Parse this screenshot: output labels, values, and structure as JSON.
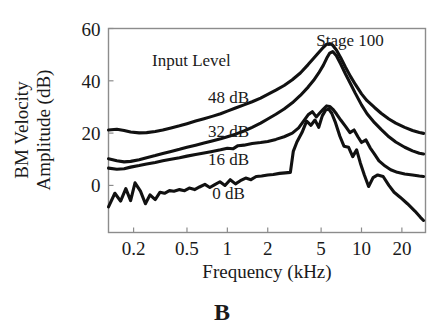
{
  "figure": {
    "panel_letter": "B",
    "background_color": "#ffffff",
    "curve_color": "#111111",
    "frame_color": "#8c8c8c"
  },
  "chart_data": {
    "type": "line",
    "title": "",
    "annotation_title": "Stage 100",
    "legend_heading": "Input Level",
    "xlabel": "Frequency  (kHz)",
    "ylabel_line1": "BM  Velocity",
    "ylabel_line2": "Amplitude  (dB)",
    "xscale": "log",
    "xlim": [
      0.13,
      30
    ],
    "ylim": [
      -18,
      60
    ],
    "xticks": [
      0.2,
      0.5,
      1,
      2,
      5,
      10,
      20
    ],
    "xtick_labels": [
      "0.2",
      "0.5",
      "1",
      "2",
      "5",
      "10",
      "20"
    ],
    "yticks": [
      0,
      20,
      40,
      60
    ],
    "ytick_labels": [
      "0",
      "20",
      "40",
      "60"
    ],
    "grid": false,
    "legend_position": "inline-curve-labels",
    "series": [
      {
        "name": "48 dB",
        "label": "48 dB",
        "label_x": 1.02,
        "label_y": 31.5,
        "x": [
          0.13,
          0.15,
          0.17,
          0.19,
          0.22,
          0.25,
          0.29,
          0.33,
          0.38,
          0.44,
          0.5,
          0.58,
          0.67,
          0.77,
          0.89,
          1.0,
          1.15,
          1.33,
          1.53,
          1.77,
          2.0,
          2.3,
          2.65,
          3.05,
          3.5,
          4.0,
          4.4,
          4.8,
          5.2,
          5.5,
          5.8,
          6.1,
          6.5,
          7.0,
          7.6,
          8.3,
          9.0,
          10.0,
          11.0,
          12.5,
          14.0,
          16.0,
          18.0,
          21.0,
          24.0,
          27.0,
          29.0
        ],
        "y": [
          21.2,
          21.5,
          21.0,
          20.4,
          20.1,
          20.2,
          20.6,
          21.2,
          22.0,
          22.8,
          23.6,
          24.6,
          25.5,
          26.4,
          27.4,
          28.4,
          29.6,
          30.8,
          32.0,
          33.4,
          34.8,
          36.4,
          38.2,
          40.4,
          43.0,
          46.2,
          48.6,
          50.8,
          52.8,
          54.0,
          54.2,
          53.6,
          51.8,
          48.8,
          45.2,
          41.6,
          38.6,
          35.0,
          32.4,
          29.8,
          27.6,
          25.4,
          23.8,
          22.2,
          21.0,
          20.2,
          19.9
        ]
      },
      {
        "name": "32 dB",
        "label": "32 dB",
        "label_x": 1.02,
        "label_y": 18.5,
        "x": [
          0.13,
          0.15,
          0.17,
          0.19,
          0.22,
          0.25,
          0.29,
          0.33,
          0.38,
          0.44,
          0.5,
          0.58,
          0.67,
          0.77,
          0.89,
          1.0,
          1.15,
          1.33,
          1.53,
          1.77,
          2.0,
          2.3,
          2.65,
          3.05,
          3.5,
          4.0,
          4.4,
          4.8,
          5.2,
          5.5,
          5.8,
          6.1,
          6.5,
          7.0,
          7.6,
          8.3,
          9.0,
          10.0,
          11.0,
          12.5,
          14.0,
          16.0,
          18.0,
          21.0,
          24.0,
          27.0,
          29.0
        ],
        "y": [
          10.2,
          9.4,
          9.0,
          9.2,
          9.8,
          10.6,
          11.4,
          12.2,
          13.0,
          13.8,
          14.6,
          15.4,
          16.2,
          17.0,
          17.8,
          18.6,
          19.6,
          20.8,
          22.2,
          23.8,
          25.4,
          27.2,
          29.2,
          31.6,
          34.4,
          37.6,
          40.2,
          43.0,
          46.0,
          48.6,
          50.6,
          51.2,
          49.6,
          46.4,
          42.6,
          38.8,
          35.2,
          30.8,
          27.4,
          24.0,
          21.4,
          18.6,
          16.6,
          14.6,
          13.2,
          12.3,
          12.0
        ]
      },
      {
        "name": "16 dB",
        "label": "16 dB",
        "label_x": 1.02,
        "label_y": 8.0,
        "x": [
          0.13,
          0.15,
          0.17,
          0.19,
          0.22,
          0.25,
          0.29,
          0.33,
          0.38,
          0.44,
          0.5,
          0.58,
          0.67,
          0.77,
          0.89,
          1.0,
          1.1,
          1.2,
          1.33,
          1.53,
          1.77,
          2.0,
          2.3,
          2.65,
          3.05,
          3.4,
          3.7,
          4.0,
          4.3,
          4.6,
          4.9,
          5.2,
          5.5,
          5.8,
          6.1,
          6.5,
          7.0,
          7.6,
          8.2,
          8.8,
          9.4,
          10.0,
          10.8,
          11.6,
          12.5,
          13.5,
          15.0,
          16.5,
          18.5,
          21.0,
          24.0,
          27.0,
          29.0
        ],
        "y": [
          6.6,
          6.2,
          6.4,
          7.0,
          7.6,
          8.2,
          8.8,
          9.4,
          10.0,
          10.6,
          11.2,
          11.8,
          12.4,
          13.0,
          13.6,
          14.2,
          14.0,
          15.2,
          15.4,
          16.0,
          16.4,
          16.8,
          17.6,
          18.6,
          20.0,
          22.0,
          24.6,
          27.0,
          28.2,
          26.2,
          27.8,
          29.2,
          30.4,
          30.2,
          29.2,
          27.4,
          25.0,
          22.6,
          20.2,
          21.2,
          18.6,
          16.4,
          17.4,
          14.4,
          12.0,
          9.4,
          7.4,
          6.0,
          5.0,
          4.4,
          4.0,
          3.6,
          3.4
        ]
      },
      {
        "name": "0 dB",
        "label": "0 dB",
        "label_x": 1.02,
        "label_y": -5.0,
        "x": [
          0.13,
          0.145,
          0.16,
          0.175,
          0.19,
          0.205,
          0.225,
          0.245,
          0.265,
          0.29,
          0.315,
          0.34,
          0.37,
          0.4,
          0.44,
          0.48,
          0.52,
          0.57,
          0.62,
          0.68,
          0.74,
          0.8,
          0.88,
          0.96,
          1.05,
          1.15,
          1.25,
          1.37,
          1.5,
          1.64,
          1.8,
          2.0,
          2.2,
          2.45,
          2.7,
          2.95,
          3.1,
          3.3,
          3.6,
          3.9,
          4.2,
          4.5,
          4.8,
          5.1,
          5.4,
          5.7,
          6.0,
          6.4,
          6.9,
          7.4,
          8.0,
          8.6,
          9.2,
          9.8,
          10.5,
          11.3,
          12.2,
          13.2,
          14.5,
          16.0,
          17.5,
          19.5,
          22.0,
          25.0,
          27.5,
          29.0
        ],
        "y": [
          -8.2,
          -3.0,
          -6.0,
          -1.2,
          -5.8,
          1.0,
          -2.2,
          -7.0,
          -3.6,
          -5.4,
          -2.6,
          -3.0,
          -2.0,
          -2.2,
          -1.6,
          -2.0,
          -1.0,
          -1.6,
          -0.6,
          0.4,
          -0.8,
          0.2,
          1.4,
          0.0,
          2.2,
          0.6,
          1.8,
          2.8,
          2.2,
          3.4,
          3.6,
          4.0,
          4.2,
          4.6,
          4.8,
          5.0,
          13.0,
          16.6,
          20.2,
          24.6,
          23.0,
          25.0,
          22.2,
          26.6,
          28.8,
          29.2,
          27.6,
          24.0,
          18.8,
          15.0,
          14.6,
          11.0,
          13.6,
          8.6,
          4.0,
          -0.4,
          3.0,
          4.0,
          3.4,
          0.0,
          -2.6,
          -4.6,
          -7.0,
          -9.8,
          -12.2,
          -13.4
        ]
      }
    ]
  }
}
